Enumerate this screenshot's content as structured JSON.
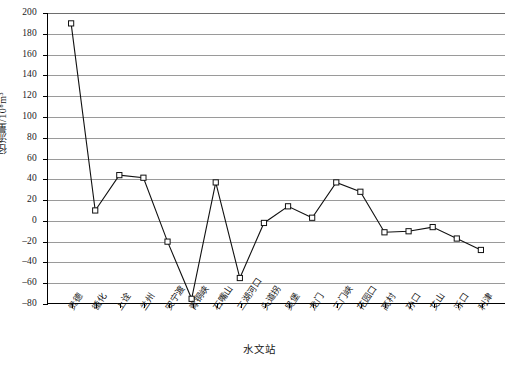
{
  "chart_data": {
    "type": "line",
    "title": "",
    "xlabel": "水文站",
    "ylabel": "径流量/10⁸m³",
    "ylim": [
      -80,
      200
    ],
    "ytick_step": 20,
    "grid": true,
    "legend": "none",
    "marker": "open-square",
    "line_color": "#111111",
    "grid_color": "#9a9a9a",
    "categories": [
      "贵德",
      "循化",
      "上诠",
      "兰州",
      "安宁渡",
      "青铜峡",
      "石嘴山",
      "三湖河口",
      "头道拐",
      "吴堡",
      "龙门",
      "三门峡",
      "花园口",
      "高村",
      "孙口",
      "艾山",
      "泺口",
      "利津"
    ],
    "values": [
      190,
      10,
      44,
      41.5,
      -20,
      -75,
      37,
      -55,
      -2,
      14,
      3,
      37,
      28,
      -11,
      -10,
      -6,
      -17,
      -28
    ],
    "ytick_labels": [
      "200",
      "180",
      "160",
      "140",
      "120",
      "100",
      "80",
      "60",
      "40",
      "20",
      "0",
      "-20",
      "-40",
      "-60",
      "-80"
    ],
    "ytick_values": [
      200,
      180,
      160,
      140,
      120,
      100,
      80,
      60,
      40,
      20,
      0,
      -20,
      -40,
      -60,
      -80
    ]
  }
}
